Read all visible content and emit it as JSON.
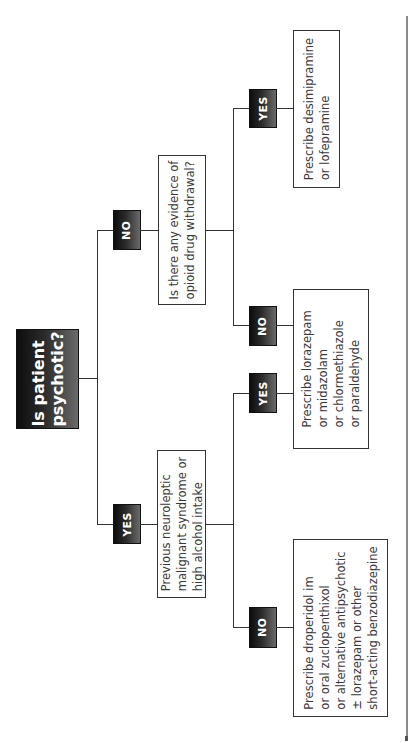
{
  "diagram": {
    "orientation": "rotated-90-ccw",
    "root": {
      "label_lines": [
        "Is patient",
        "psychotic?"
      ]
    },
    "branches": {
      "yes": {
        "label": "YES",
        "question": {
          "lines": [
            "Previous neuroleptic",
            "malignant syndrome or",
            "high alcohol intake"
          ]
        },
        "yes": {
          "label": "YES",
          "outcome": {
            "lines": [
              "Prescribe lorazepam",
              "or midazolam",
              "or chlormethiazole",
              "or paraldehyde"
            ]
          }
        },
        "no": {
          "label": "NO",
          "outcome": {
            "lines": [
              "Prescribe droperidol im",
              "or oral zuclopenthixol",
              "or alternative antipsychotic",
              "± lorazepam or other",
              "short-acting benzodiazepine"
            ]
          }
        }
      },
      "no": {
        "label": "NO",
        "question": {
          "lines": [
            "Is there any evidence of",
            "opioid drug withdrawal?"
          ]
        },
        "yes": {
          "label": "YES",
          "outcome": {
            "lines": [
              "Prescribe desimipramine",
              "or lofepramine"
            ]
          }
        },
        "no": {
          "label": "NO",
          "outcome": {
            "lines": [
              "Prescribe lorazepam",
              "or midazolam",
              "or chlormethiazole",
              "or paraldehyde"
            ]
          }
        }
      }
    },
    "colors": {
      "node_dark": "#1a1a1a",
      "line": "#333333",
      "text": "#3a3a3a",
      "rule": "#8a8a8a"
    }
  }
}
